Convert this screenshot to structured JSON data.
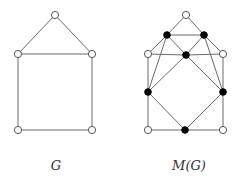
{
  "figures": [
    {
      "id": "G",
      "label": "G",
      "label_pos": [
        56,
        158
      ],
      "vertices": [
        {
          "id": "a",
          "x": 55,
          "y": 15,
          "type": "open"
        },
        {
          "id": "b",
          "x": 18,
          "y": 54,
          "type": "open"
        },
        {
          "id": "c",
          "x": 92,
          "y": 54,
          "type": "open"
        },
        {
          "id": "d",
          "x": 18,
          "y": 130,
          "type": "open"
        },
        {
          "id": "e",
          "x": 92,
          "y": 130,
          "type": "open"
        }
      ],
      "edges": [
        [
          "a",
          "b"
        ],
        [
          "a",
          "c"
        ],
        [
          "b",
          "c"
        ],
        [
          "b",
          "d"
        ],
        [
          "c",
          "e"
        ],
        [
          "d",
          "e"
        ]
      ]
    },
    {
      "id": "MG",
      "label": "M(G)",
      "label_pos": [
        189,
        158
      ],
      "vertices": [
        {
          "id": "a",
          "x": 186,
          "y": 15,
          "type": "open"
        },
        {
          "id": "b",
          "x": 148,
          "y": 54,
          "type": "open"
        },
        {
          "id": "c",
          "x": 223,
          "y": 54,
          "type": "open"
        },
        {
          "id": "d",
          "x": 148,
          "y": 130,
          "type": "open"
        },
        {
          "id": "e",
          "x": 223,
          "y": 130,
          "type": "open"
        },
        {
          "id": "ab",
          "x": 167,
          "y": 35,
          "type": "filled"
        },
        {
          "id": "ac",
          "x": 204,
          "y": 35,
          "type": "filled"
        },
        {
          "id": "bc",
          "x": 186,
          "y": 55,
          "type": "filled"
        },
        {
          "id": "bd",
          "x": 148,
          "y": 92,
          "type": "filled"
        },
        {
          "id": "ce",
          "x": 223,
          "y": 92,
          "type": "filled"
        },
        {
          "id": "de",
          "x": 185,
          "y": 130,
          "type": "filled"
        }
      ],
      "edges": [
        [
          "a",
          "ab"
        ],
        [
          "ab",
          "b"
        ],
        [
          "a",
          "ac"
        ],
        [
          "ac",
          "c"
        ],
        [
          "b",
          "bc"
        ],
        [
          "bc",
          "c"
        ],
        [
          "b",
          "bd"
        ],
        [
          "bd",
          "d"
        ],
        [
          "c",
          "ce"
        ],
        [
          "ce",
          "e"
        ],
        [
          "d",
          "de"
        ],
        [
          "de",
          "e"
        ],
        [
          "ab",
          "ac"
        ],
        [
          "ab",
          "bc"
        ],
        [
          "ac",
          "bc"
        ],
        [
          "ab",
          "bd"
        ],
        [
          "ac",
          "ce"
        ],
        [
          "bc",
          "bd"
        ],
        [
          "bc",
          "ce"
        ],
        [
          "bd",
          "de"
        ],
        [
          "ce",
          "de"
        ]
      ]
    }
  ],
  "colors": {
    "edge": "#6a6a6a",
    "open_vertex_stroke": "#555555",
    "filled_vertex": "#000000",
    "label": "#333333"
  }
}
